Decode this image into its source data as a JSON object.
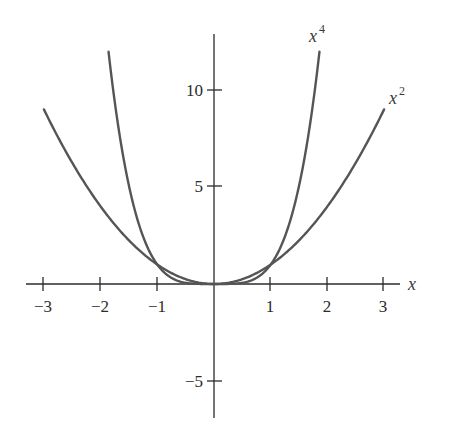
{
  "chart_data": {
    "type": "line",
    "title": "",
    "xlabel": "x",
    "ylabel": "",
    "xlim": [
      -3.3,
      3.3
    ],
    "ylim": [
      -7,
      13
    ],
    "grid": false,
    "legend": "inline curve labels",
    "x_ticks": [
      -3,
      -2,
      -1,
      1,
      2,
      3
    ],
    "x_tick_labels": [
      "−3",
      "−2",
      "−1",
      "1",
      "2",
      "3"
    ],
    "y_ticks": [
      10,
      5,
      -5
    ],
    "y_tick_labels": [
      "10",
      "5",
      "−5"
    ],
    "series": [
      {
        "name": "x^2",
        "label_base": "x",
        "label_exp": "2",
        "exponent": 2,
        "domain": [
          -3,
          3
        ],
        "points": [
          [
            -3,
            9
          ],
          [
            -2,
            4
          ],
          [
            -1,
            1
          ],
          [
            0,
            0
          ],
          [
            1,
            1
          ],
          [
            2,
            4
          ],
          [
            3,
            9
          ]
        ]
      },
      {
        "name": "x^4",
        "label_base": "x",
        "label_exp": "4",
        "exponent": 4,
        "domain": [
          -1.86,
          1.86
        ],
        "points": [
          [
            -1.86,
            12
          ],
          [
            -1.5,
            5.06
          ],
          [
            -1,
            1
          ],
          [
            0,
            0
          ],
          [
            1,
            1
          ],
          [
            1.5,
            5.06
          ],
          [
            1.86,
            12
          ]
        ]
      }
    ],
    "annotations": [
      "x^4 label near top of quartic curve",
      "x^2 label near top of quadratic curve"
    ]
  },
  "labels": {
    "x_axis": "x",
    "x2_base": "x",
    "x2_exp": "2",
    "x4_base": "x",
    "x4_exp": "4",
    "xt_m3": "−3",
    "xt_m2": "−2",
    "xt_m1": "−1",
    "xt_1": "1",
    "xt_2": "2",
    "xt_3": "3",
    "yt_10": "10",
    "yt_5": "5",
    "yt_m5": "−5"
  },
  "colors": {
    "axis": "#2b2b2b",
    "curve": "#555555",
    "background": "#ffffff"
  }
}
